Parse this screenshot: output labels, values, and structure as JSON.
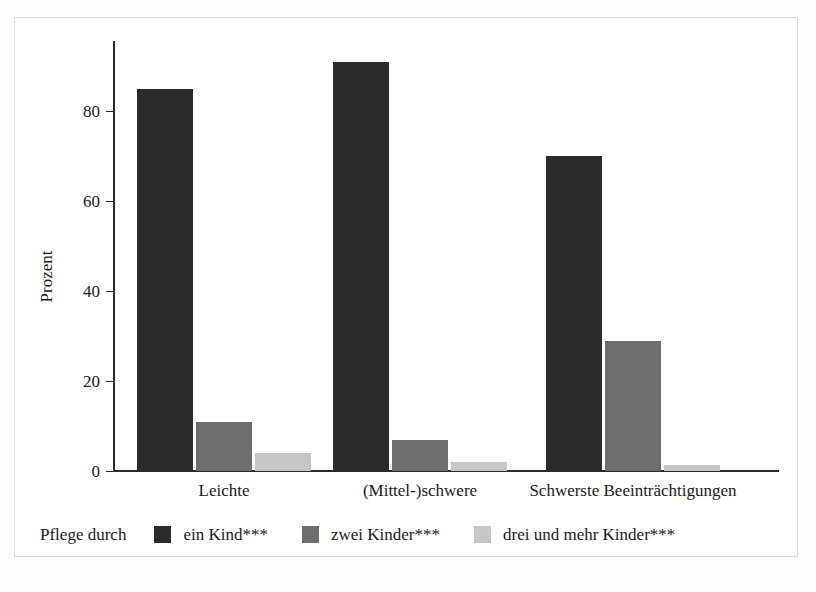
{
  "chart_data": {
    "type": "bar",
    "title": "",
    "subtitle": "",
    "xlabel": "",
    "ylabel": "Prozent",
    "categories": [
      "Leichte",
      "(Mittel-)schwere",
      "Schwerste Beeinträchtigungen"
    ],
    "series": [
      {
        "name": "ein Kind***",
        "color": "#2b2b2b",
        "values": [
          85,
          91,
          70
        ]
      },
      {
        "name": "zwei Kinder***",
        "color": "#6e6e6e",
        "values": [
          11,
          7,
          29
        ]
      },
      {
        "name": "drei und mehr Kinder***",
        "color": "#c6c6c6",
        "values": [
          4,
          2,
          1.3
        ]
      }
    ],
    "ylim": [
      0,
      96
    ],
    "yticks": [
      0,
      20,
      40,
      60,
      80
    ],
    "ytick_labels": [
      "0",
      "20",
      "40",
      "60",
      "80"
    ],
    "grid": false,
    "legend_position": "bottom",
    "legend_title": "Pflege durch"
  },
  "axis": {
    "y_title": "Prozent",
    "tick_0": "0",
    "tick_20": "20",
    "tick_40": "40",
    "tick_60": "60",
    "tick_80": "80"
  },
  "categories": {
    "c0": "Leichte",
    "c1": "(Mittel-)schwere",
    "c2": "Schwerste Beeinträchtigungen"
  },
  "legend": {
    "title": "Pflege durch",
    "items": [
      {
        "label": "ein Kind***",
        "color": "#2b2b2b"
      },
      {
        "label": "zwei Kinder***",
        "color": "#6e6e6e"
      },
      {
        "label": "drei und mehr Kinder***",
        "color": "#c6c6c6"
      }
    ]
  },
  "colors": {
    "series_1": "#2b2b2b",
    "series_2": "#6e6e6e",
    "series_3": "#c6c6c6",
    "axis": "#2b2b2b",
    "frame": "#dcdcdc",
    "background": "#ffffff"
  }
}
